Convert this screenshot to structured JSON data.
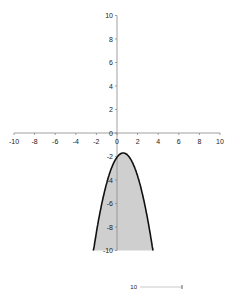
{
  "chart_data": {
    "type": "area",
    "title": "",
    "xlabel": "",
    "ylabel": "",
    "xlim": [
      -10,
      10
    ],
    "ylim": [
      -10,
      10
    ],
    "grid": false,
    "legend": null,
    "x_ticks": [
      -10,
      -8,
      -6,
      -4,
      -2,
      0,
      2,
      4,
      6,
      8,
      10
    ],
    "y_ticks": [
      -10,
      -8,
      -6,
      -4,
      -2,
      0,
      2,
      4,
      6,
      8,
      10
    ],
    "y_ticks_visible": [
      -10,
      -8,
      -6,
      -4,
      -2,
      0,
      2,
      4,
      6,
      8,
      10
    ],
    "series": [
      {
        "name": "y = -(x - 0.6)^2 - 1.7",
        "x": [
          -2.3,
          -2,
          -1.5,
          -1,
          -0.5,
          0,
          0.6,
          1,
          1.5,
          2,
          2.5,
          3,
          3.5
        ],
        "y": [
          -10.11,
          -8.46,
          -6.11,
          -4.26,
          -2.91,
          -2.06,
          -1.7,
          -1.86,
          -2.51,
          -3.66,
          -5.31,
          -7.46,
          -10.11
        ],
        "fill_to": -10,
        "fill_color": "#cfcfcf",
        "line_color": "#111111"
      }
    ],
    "annotations": [
      {
        "text": "10",
        "position": "bottom, partially cropped second chart"
      }
    ]
  },
  "colors": {
    "axis": "#888888",
    "curve": "#111111",
    "fill": "#cfcfcf",
    "background": "#ffffff"
  },
  "cropped_footer": {
    "label": "10"
  }
}
